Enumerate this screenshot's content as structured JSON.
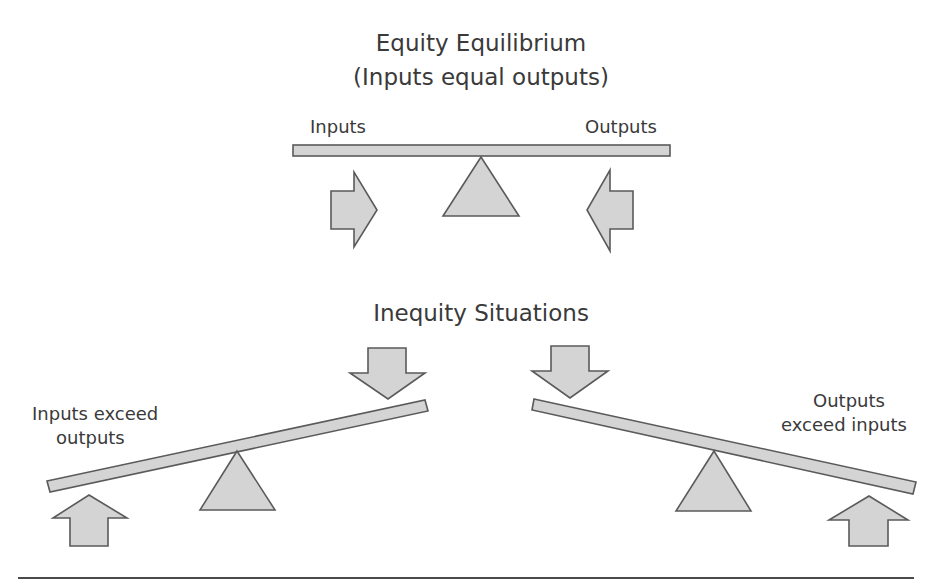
{
  "equilibrium": {
    "title": "Equity Equilibrium",
    "subtitle": "(Inputs equal outputs)",
    "left_label": "Inputs",
    "right_label": "Outputs"
  },
  "inequity": {
    "title": "Inequity Situations",
    "left_scenario": {
      "line1": "Inputs exceed",
      "line2": "outputs"
    },
    "right_scenario": {
      "line1": "Outputs",
      "line2": "exceed inputs"
    }
  },
  "icons": {
    "beam": "balance-beam",
    "fulcrum": "triangle-fulcrum",
    "arrows": [
      "arrow-right-icon",
      "arrow-left-icon",
      "arrow-down-icon",
      "arrow-up-icon"
    ]
  },
  "colors": {
    "shape_fill": "#d4d4d4",
    "shape_stroke": "#5a5a5a",
    "text": "#3a3a3a",
    "rule": "#4a4a4a"
  }
}
